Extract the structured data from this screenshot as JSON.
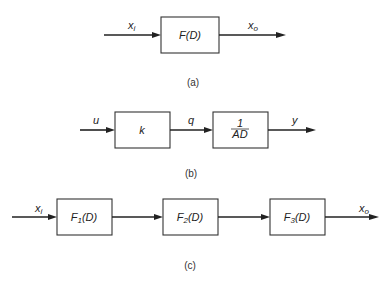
{
  "diagrams": {
    "a": {
      "caption": "(a)",
      "input_label": "x",
      "input_sub": "i",
      "output_label": "x",
      "output_sub": "o",
      "block": "F(D)"
    },
    "b": {
      "caption": "(b)",
      "input_label": "u",
      "middle_label": "q",
      "output_label": "y",
      "block1": "k",
      "block2_num": "1",
      "block2_den": "AD"
    },
    "c": {
      "caption": "(c)",
      "input_label": "x",
      "input_sub": "i",
      "output_label": "x",
      "output_sub": "o",
      "block1_f": "F",
      "block1_sub": "1",
      "block1_arg": "(D)",
      "block2_f": "F",
      "block2_sub": "2",
      "block2_arg": "(D)",
      "block3_f": "F",
      "block3_sub": "3",
      "block3_arg": "(D)"
    }
  },
  "colors": {
    "line": "#222222",
    "background": "#ffffff"
  }
}
